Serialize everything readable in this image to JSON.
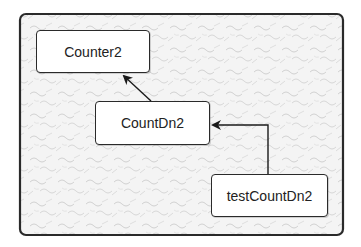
{
  "diagram": {
    "frame": {
      "x": 20,
      "y": 14,
      "width": 323,
      "height": 221,
      "pattern": "marble-texture"
    },
    "nodes": [
      {
        "id": "counter2",
        "label": "Counter2",
        "x": 36,
        "y": 30,
        "width": 114,
        "height": 43
      },
      {
        "id": "countdn2",
        "label": "CountDn2",
        "x": 95,
        "y": 101,
        "width": 115,
        "height": 44
      },
      {
        "id": "testcountdn2",
        "label": "testCountDn2",
        "x": 211,
        "y": 174,
        "width": 117,
        "height": 43
      }
    ],
    "edges": [
      {
        "from": "countdn2",
        "to": "counter2",
        "type": "arrow",
        "style": "straight"
      },
      {
        "from": "testcountdn2",
        "to": "countdn2",
        "type": "arrow",
        "style": "orthogonal"
      }
    ]
  }
}
